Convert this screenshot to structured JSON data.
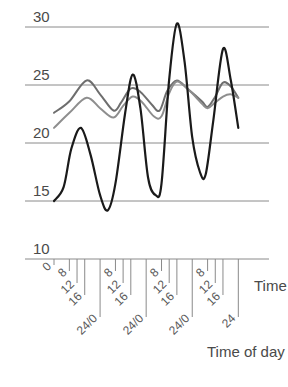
{
  "chart_data": {
    "type": "line",
    "title": "",
    "xlabel": "Time of day",
    "x_axis_end_label": "Time",
    "ylabel": "",
    "ylim": [
      10,
      31
    ],
    "yticks": [
      10,
      15,
      20,
      25,
      30
    ],
    "grid": true,
    "legend": null,
    "xticks": [
      {
        "hour": 0,
        "label": "0"
      },
      {
        "hour": 8,
        "label": "8"
      },
      {
        "hour": 12,
        "label": "12"
      },
      {
        "hour": 16,
        "label": "16"
      },
      {
        "hour": 24,
        "label": "24/0"
      },
      {
        "hour": 32,
        "label": "8"
      },
      {
        "hour": 36,
        "label": "12"
      },
      {
        "hour": 40,
        "label": "16"
      },
      {
        "hour": 48,
        "label": "24/0"
      },
      {
        "hour": 56,
        "label": "8"
      },
      {
        "hour": 60,
        "label": "12"
      },
      {
        "hour": 64,
        "label": "16"
      },
      {
        "hour": 72,
        "label": "24/0"
      },
      {
        "hour": 80,
        "label": "8"
      },
      {
        "hour": 84,
        "label": "12"
      },
      {
        "hour": 88,
        "label": "16"
      },
      {
        "hour": 96,
        "label": "24"
      }
    ],
    "series": [
      {
        "name": "black-curve",
        "color": "#1a1a1a",
        "width": 2.2,
        "points": [
          [
            0,
            15.0
          ],
          [
            5,
            16.2
          ],
          [
            9,
            19.5
          ],
          [
            14,
            21.3
          ],
          [
            19,
            19.0
          ],
          [
            24,
            15.5
          ],
          [
            28,
            14.2
          ],
          [
            32,
            16.5
          ],
          [
            37,
            22.5
          ],
          [
            41,
            25.9
          ],
          [
            45,
            23.0
          ],
          [
            49,
            17.0
          ],
          [
            53,
            15.5
          ],
          [
            56,
            16.5
          ],
          [
            60,
            25.5
          ],
          [
            64,
            30.3
          ],
          [
            68,
            27.0
          ],
          [
            72,
            20.5
          ],
          [
            76,
            17.5
          ],
          [
            79,
            17.3
          ],
          [
            83,
            22.0
          ],
          [
            88,
            28.1
          ],
          [
            92,
            25.5
          ],
          [
            96,
            21.3
          ]
        ]
      },
      {
        "name": "upper-gray-curve",
        "color": "#6e6e6e",
        "width": 2,
        "points": [
          [
            0,
            22.6
          ],
          [
            8,
            23.6
          ],
          [
            17,
            25.4
          ],
          [
            24,
            24.2
          ],
          [
            31,
            22.8
          ],
          [
            35,
            23.5
          ],
          [
            40,
            24.7
          ],
          [
            45,
            24.4
          ],
          [
            51,
            23.3
          ],
          [
            55,
            22.8
          ],
          [
            59,
            24.5
          ],
          [
            64,
            25.4
          ],
          [
            70,
            24.6
          ],
          [
            77,
            23.6
          ],
          [
            80,
            23.1
          ],
          [
            84,
            24.0
          ],
          [
            88,
            25.2
          ],
          [
            92,
            24.9
          ],
          [
            96,
            23.9
          ]
        ]
      },
      {
        "name": "lower-gray-curve",
        "color": "#8e8e8e",
        "width": 2,
        "points": [
          [
            0,
            21.3
          ],
          [
            8,
            22.6
          ],
          [
            17,
            23.9
          ],
          [
            24,
            23.0
          ],
          [
            31,
            22.2
          ],
          [
            36,
            23.2
          ],
          [
            41,
            24.0
          ],
          [
            46,
            23.5
          ],
          [
            52,
            22.3
          ],
          [
            56,
            22.3
          ],
          [
            60,
            24.3
          ],
          [
            64,
            25.3
          ],
          [
            70,
            24.6
          ],
          [
            77,
            23.4
          ],
          [
            80,
            23.0
          ],
          [
            84,
            23.5
          ],
          [
            88,
            24.0
          ],
          [
            92,
            24.2
          ],
          [
            96,
            23.9
          ]
        ]
      }
    ]
  },
  "labels": {
    "xlabel": "Time of day",
    "time": "Time",
    "y": [
      "10",
      "15",
      "20",
      "25",
      "30"
    ]
  }
}
